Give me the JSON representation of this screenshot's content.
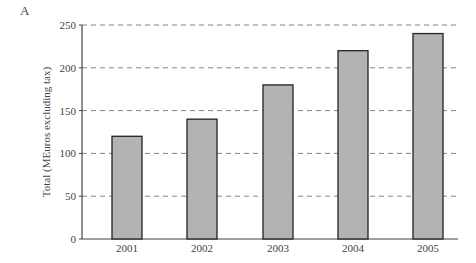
{
  "panel_label": "A",
  "chart_data": {
    "type": "bar",
    "title": "",
    "xlabel": "",
    "ylabel": "Total (MEuros excluding tax)",
    "categories": [
      "2001",
      "2002",
      "2003",
      "2004",
      "2005"
    ],
    "values": [
      120,
      140,
      180,
      220,
      240
    ],
    "ylim": [
      0,
      250
    ],
    "yticks": [
      0,
      50,
      100,
      150,
      200,
      250
    ],
    "grid": "horizontal dashed",
    "legend": "none",
    "bar_color": "#b3b3b3",
    "bar_edge_color": "#222222"
  }
}
